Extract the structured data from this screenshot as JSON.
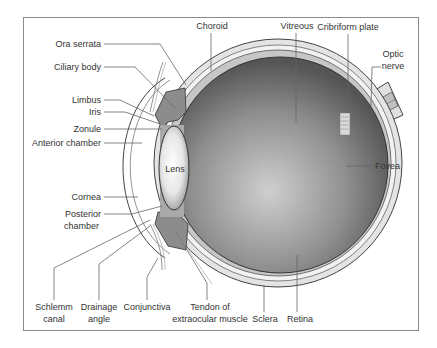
{
  "diagram": {
    "type": "anatomical-cross-section",
    "colors": {
      "frame": "#8a8a8a",
      "sclera": "#e4e4e4",
      "choroid": "#bdbdbd",
      "vitreous_center": "#c9c9c9",
      "vitreous_edge": "#5a5a5a",
      "ciliary": "#8c8c8c",
      "lens_center": "#ffffff",
      "lens_edge": "#9a9a9a",
      "text": "#333333",
      "leader": "#666666"
    },
    "labels": {
      "ora_serrata": "Ora serrata",
      "ciliary_body": "Ciliary body",
      "limbus": "Limbus",
      "iris": "Iris",
      "zonule": "Zonule",
      "anterior_chamber": "Anterior chamber",
      "cornea": "Cornea",
      "posterior_chamber_1": "Posterior",
      "posterior_chamber_2": "chamber",
      "lens": "Lens",
      "choroid": "Choroid",
      "vitreous": "Vitreous",
      "cribriform_plate": "Cribriform plate",
      "optic_nerve_1": "Optic",
      "optic_nerve_2": "nerve",
      "fovea": "Fovea",
      "schlemm_canal_1": "Schlemm",
      "schlemm_canal_2": "canal",
      "drainage_angle_1": "Drainage",
      "drainage_angle_2": "angle",
      "conjunctiva": "Conjunctiva",
      "tendon_1": "Tendon of",
      "tendon_2": "extraocular muscle",
      "sclera": "Sclera",
      "retina": "Retina"
    }
  }
}
